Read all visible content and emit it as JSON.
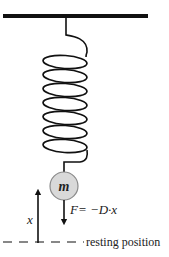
{
  "diagram": {
    "mass_label": "m",
    "force_label": "F= −D·x",
    "displacement_label": "x",
    "resting_label": "resting position",
    "spring_coils": 7,
    "colors": {
      "line": "#111111",
      "mass_fill": "#d9d9d9",
      "mass_stroke": "#8a8a8a",
      "text": "#222222"
    }
  }
}
